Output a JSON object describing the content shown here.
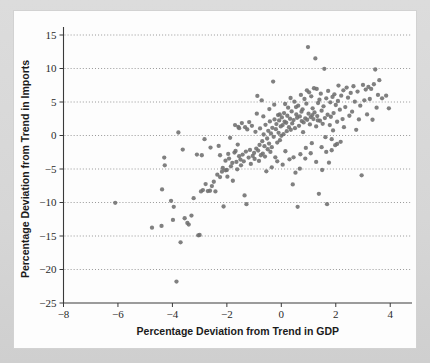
{
  "figure": {
    "background_color": "#d9d9d9",
    "card_color": "#fdfdfd",
    "marker_color": "#6e6e6e",
    "grid_color": "#8d8d8d",
    "axis_color": "#3a3a3a"
  },
  "chart_data": {
    "type": "scatter",
    "title": "",
    "xlabel": "Percentage Deviation from Trend in GDP",
    "ylabel": "Percentage Deviation from Trend in Imports",
    "xlim": [
      -8,
      4.8
    ],
    "ylim": [
      -25,
      15
    ],
    "xticks": [
      -8,
      -6,
      -4,
      -2,
      0,
      2,
      4
    ],
    "xtick_labels": [
      "−8",
      "−6",
      "−4",
      "−2",
      "0",
      "2",
      "4"
    ],
    "yticks": [
      -25,
      -20,
      -15,
      -10,
      -5,
      0,
      5,
      10,
      15
    ],
    "ytick_labels": [
      "−25",
      "−20",
      "−15",
      "−10",
      "−5",
      "0",
      "5",
      "10",
      "15"
    ],
    "grid": {
      "horizontal": true,
      "vertical": false,
      "style": "dotted",
      "levels": [
        15,
        10,
        5,
        0,
        -5,
        -10,
        -15,
        -20
      ]
    },
    "legend": null,
    "marker": {
      "shape": "circle",
      "size_px": 4.3,
      "color": "#6e6e6e"
    },
    "points": [
      [
        -6.1,
        -10.05
      ],
      [
        -4.75,
        -13.75
      ],
      [
        -4.4,
        -13.5
      ],
      [
        -4.38,
        -8.05
      ],
      [
        -4.3,
        -3.3
      ],
      [
        -4.28,
        -4.45
      ],
      [
        -4.05,
        -9.75
      ],
      [
        -3.98,
        -12.6
      ],
      [
        -3.95,
        -10.65
      ],
      [
        -3.85,
        -21.8
      ],
      [
        -3.78,
        0.45
      ],
      [
        -3.7,
        -15.95
      ],
      [
        -3.62,
        -2.1
      ],
      [
        -3.55,
        -12.35
      ],
      [
        -3.45,
        -13.05
      ],
      [
        -3.4,
        -13.3
      ],
      [
        -3.3,
        -11.95
      ],
      [
        -3.22,
        -9.35
      ],
      [
        -3.1,
        -2.85
      ],
      [
        -3.05,
        -14.9
      ],
      [
        -3.0,
        -14.85
      ],
      [
        -2.95,
        -8.35
      ],
      [
        -2.88,
        -8.15
      ],
      [
        -2.82,
        -0.55
      ],
      [
        -2.78,
        -7.25
      ],
      [
        -2.7,
        -8.3
      ],
      [
        -2.62,
        -8.25
      ],
      [
        -2.55,
        -7.55
      ],
      [
        -2.48,
        -6.9
      ],
      [
        -2.42,
        -8.35
      ],
      [
        -2.35,
        -5.85
      ],
      [
        -2.3,
        -1.55
      ],
      [
        -2.25,
        -6.2
      ],
      [
        -2.18,
        -5.4
      ],
      [
        -2.12,
        -10.6
      ],
      [
        -2.05,
        -5.2
      ],
      [
        -2.0,
        -5.15
      ],
      [
        -1.95,
        -2.75
      ],
      [
        -1.92,
        -3.45
      ],
      [
        -1.88,
        -0.35
      ],
      [
        -1.85,
        -4.6
      ],
      [
        -1.8,
        -4.1
      ],
      [
        -1.78,
        -6.75
      ],
      [
        -1.72,
        -2.55
      ],
      [
        -1.68,
        -2.3
      ],
      [
        -1.65,
        -3.95
      ],
      [
        -1.6,
        -1.35
      ],
      [
        -1.58,
        1.3
      ],
      [
        -1.55,
        -3.1
      ],
      [
        -1.5,
        -3.6
      ],
      [
        -1.45,
        1.85
      ],
      [
        -1.42,
        -2.85
      ],
      [
        -1.38,
        -3.85
      ],
      [
        -1.35,
        -8.95
      ],
      [
        -1.3,
        -2.4
      ],
      [
        -1.28,
        -10.25
      ],
      [
        -1.25,
        0.9
      ],
      [
        -1.2,
        -3.3
      ],
      [
        -1.15,
        -2.15
      ],
      [
        -1.12,
        -4.25
      ],
      [
        -1.08,
        1.45
      ],
      [
        -1.05,
        -3.05
      ],
      [
        -1.0,
        -2.6
      ],
      [
        -0.98,
        -3.5
      ],
      [
        -0.95,
        0.55
      ],
      [
        -0.92,
        -1.95
      ],
      [
        -0.88,
        5.9
      ],
      [
        -0.85,
        -2.25
      ],
      [
        -0.82,
        -3.8
      ],
      [
        -0.8,
        -1.4
      ],
      [
        -0.78,
        1.05
      ],
      [
        -0.75,
        -2.95
      ],
      [
        -0.72,
        5.25
      ],
      [
        -0.7,
        -0.85
      ],
      [
        -0.68,
        -2.7
      ],
      [
        -0.65,
        0.15
      ],
      [
        -0.62,
        -1.6
      ],
      [
        -0.6,
        -3.15
      ],
      [
        -0.58,
        1.6
      ],
      [
        -0.55,
        -5.35
      ],
      [
        -0.52,
        -0.45
      ],
      [
        -0.5,
        -2.05
      ],
      [
        -0.48,
        0.7
      ],
      [
        -0.45,
        -1.2
      ],
      [
        -0.42,
        2.1
      ],
      [
        -0.4,
        -2.45
      ],
      [
        -0.38,
        0.3
      ],
      [
        -0.35,
        -1.75
      ],
      [
        -0.33,
        1.15
      ],
      [
        -0.3,
        8.05
      ],
      [
        -0.28,
        -0.2
      ],
      [
        -0.25,
        2.4
      ],
      [
        -0.22,
        -3.25
      ],
      [
        -0.2,
        0.95
      ],
      [
        -0.18,
        1.7
      ],
      [
        -0.15,
        -1.05
      ],
      [
        -0.12,
        3.05
      ],
      [
        -0.1,
        0.4
      ],
      [
        -0.08,
        2.25
      ],
      [
        -0.05,
        -0.7
      ],
      [
        -0.02,
        1.35
      ],
      [
        0.0,
        -0.05
      ],
      [
        0.02,
        2.7
      ],
      [
        0.05,
        1.55
      ],
      [
        0.08,
        0.2
      ],
      [
        0.1,
        3.35
      ],
      [
        0.12,
        2.05
      ],
      [
        0.15,
        -2.35
      ],
      [
        0.18,
        1.9
      ],
      [
        0.2,
        0.65
      ],
      [
        0.22,
        2.95
      ],
      [
        0.25,
        4.15
      ],
      [
        0.28,
        1.25
      ],
      [
        0.3,
        -3.55
      ],
      [
        0.32,
        2.5
      ],
      [
        0.35,
        0.85
      ],
      [
        0.38,
        3.6
      ],
      [
        0.4,
        1.8
      ],
      [
        0.42,
        -7.3
      ],
      [
        0.45,
        2.3
      ],
      [
        0.48,
        5.05
      ],
      [
        0.5,
        1.1
      ],
      [
        0.52,
        -5.55
      ],
      [
        0.55,
        3.15
      ],
      [
        0.58,
        2.65
      ],
      [
        0.6,
        -10.65
      ],
      [
        0.62,
        4.45
      ],
      [
        0.65,
        1.45
      ],
      [
        0.68,
        2.85
      ],
      [
        0.7,
        -2.8
      ],
      [
        0.72,
        6.05
      ],
      [
        0.75,
        2.15
      ],
      [
        0.78,
        3.9
      ],
      [
        0.8,
        0.5
      ],
      [
        0.82,
        1.95
      ],
      [
        0.85,
        5.45
      ],
      [
        0.88,
        2.55
      ],
      [
        0.9,
        -1.85
      ],
      [
        0.92,
        4.75
      ],
      [
        0.95,
        2.35
      ],
      [
        0.98,
        13.2
      ],
      [
        1.0,
        3.25
      ],
      [
        1.02,
        6.45
      ],
      [
        1.05,
        1.65
      ],
      [
        1.08,
        2.75
      ],
      [
        1.1,
        5.85
      ],
      [
        1.12,
        -1.15
      ],
      [
        1.15,
        4.05
      ],
      [
        1.18,
        2.45
      ],
      [
        1.2,
        7.05
      ],
      [
        1.22,
        3.45
      ],
      [
        1.25,
        11.5
      ],
      [
        1.28,
        1.35
      ],
      [
        1.3,
        6.95
      ],
      [
        1.32,
        2.9
      ],
      [
        1.35,
        4.85
      ],
      [
        1.38,
        -8.7
      ],
      [
        1.4,
        5.35
      ],
      [
        1.42,
        2.2
      ],
      [
        1.45,
        6.25
      ],
      [
        1.48,
        3.7
      ],
      [
        1.5,
        -5.15
      ],
      [
        1.52,
        1.75
      ],
      [
        1.55,
        4.35
      ],
      [
        1.58,
        9.95
      ],
      [
        1.6,
        2.6
      ],
      [
        1.62,
        -0.25
      ],
      [
        1.65,
        5.55
      ],
      [
        1.68,
        -10.25
      ],
      [
        1.7,
        3.1
      ],
      [
        1.72,
        6.65
      ],
      [
        1.75,
        -4.05
      ],
      [
        1.78,
        1.55
      ],
      [
        1.8,
        4.95
      ],
      [
        1.82,
        2.8
      ],
      [
        1.85,
        -2.2
      ],
      [
        1.88,
        5.75
      ],
      [
        1.9,
        0.75
      ],
      [
        1.92,
        3.35
      ],
      [
        1.95,
        6.15
      ],
      [
        1.98,
        -1.45
      ],
      [
        2.0,
        4.55
      ],
      [
        2.05,
        2.05
      ],
      [
        2.08,
        5.15
      ],
      [
        2.1,
        7.45
      ],
      [
        2.15,
        3.85
      ],
      [
        2.18,
        -0.95
      ],
      [
        2.2,
        5.95
      ],
      [
        2.25,
        2.45
      ],
      [
        2.28,
        6.75
      ],
      [
        2.3,
        1.25
      ],
      [
        2.35,
        4.25
      ],
      [
        2.4,
        7.15
      ],
      [
        2.45,
        5.65
      ],
      [
        2.5,
        2.95
      ],
      [
        2.55,
        6.35
      ],
      [
        2.6,
        3.55
      ],
      [
        2.65,
        7.35
      ],
      [
        2.7,
        5.05
      ],
      [
        2.75,
        0.85
      ],
      [
        2.8,
        6.55
      ],
      [
        2.85,
        2.4
      ],
      [
        2.9,
        4.45
      ],
      [
        2.95,
        -5.95
      ],
      [
        3.0,
        7.55
      ],
      [
        3.05,
        5.25
      ],
      [
        3.1,
        6.85
      ],
      [
        3.15,
        3.15
      ],
      [
        3.2,
        7.25
      ],
      [
        3.25,
        5.45
      ],
      [
        3.3,
        6.95
      ],
      [
        3.35,
        2.35
      ],
      [
        3.4,
        7.65
      ],
      [
        3.45,
        9.85
      ],
      [
        3.5,
        4.15
      ],
      [
        3.55,
        6.05
      ],
      [
        3.6,
        8.25
      ],
      [
        3.7,
        5.55
      ],
      [
        3.85,
        5.95
      ],
      [
        3.95,
        4.05
      ],
      [
        -2.92,
        -2.95
      ],
      [
        -2.6,
        -1.8
      ],
      [
        -2.15,
        -4.85
      ],
      [
        -1.98,
        -6.15
      ],
      [
        -1.62,
        -5.05
      ],
      [
        -1.48,
        -4.45
      ],
      [
        -1.33,
        1.25
      ],
      [
        -1.18,
        2.0
      ],
      [
        -0.9,
        3.25
      ],
      [
        -0.66,
        2.85
      ],
      [
        -0.44,
        3.95
      ],
      [
        -0.26,
        4.6
      ],
      [
        -0.06,
        3.15
      ],
      [
        0.14,
        4.7
      ],
      [
        0.34,
        5.6
      ],
      [
        0.54,
        4.25
      ],
      [
        0.74,
        3.55
      ],
      [
        0.94,
        6.75
      ],
      [
        1.14,
        3.05
      ],
      [
        1.34,
        2.25
      ],
      [
        -1.7,
        1.55
      ],
      [
        -1.55,
        1.1
      ],
      [
        -2.05,
        -3.75
      ],
      [
        -2.25,
        -2.95
      ],
      [
        -0.35,
        -4.75
      ],
      [
        -0.15,
        -3.85
      ],
      [
        0.05,
        -4.35
      ],
      [
        0.45,
        -3.25
      ],
      [
        0.68,
        -4.95
      ],
      [
        0.88,
        -3.45
      ],
      [
        1.08,
        -2.65
      ],
      [
        1.28,
        -3.95
      ],
      [
        1.48,
        -1.75
      ],
      [
        1.65,
        -2.45
      ],
      [
        1.85,
        -0.55
      ],
      [
        2.05,
        -1.25
      ]
    ]
  }
}
